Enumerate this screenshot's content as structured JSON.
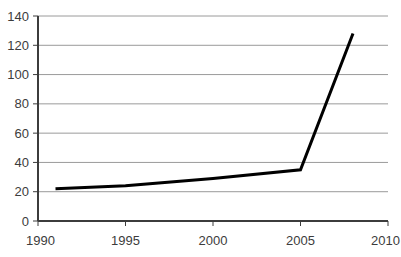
{
  "chart_data": {
    "type": "line",
    "title": "",
    "subtitle": "",
    "xlabel": "",
    "ylabel": "",
    "xlim": [
      1990,
      2010
    ],
    "ylim": [
      0,
      140
    ],
    "grid": true,
    "legend": false,
    "legend_position": "none",
    "x_ticks": [
      1990,
      1995,
      2000,
      2005,
      2010
    ],
    "y_ticks": [
      0,
      20,
      40,
      60,
      80,
      100,
      120,
      140
    ],
    "x_tick_labels": [
      "1990",
      "1995",
      "2000",
      "2005",
      "2010"
    ],
    "y_tick_labels": [
      "0",
      "20",
      "40",
      "60",
      "80",
      "100",
      "120",
      "140"
    ],
    "series": [
      {
        "name": "series-1",
        "color": "#000000",
        "line_width": 3,
        "x": [
          1991,
          1993,
          1995,
          2000,
          2005,
          2008
        ],
        "values": [
          22,
          23,
          24,
          29,
          35,
          128
        ]
      }
    ],
    "annotations": []
  },
  "style": {
    "background": "#ffffff",
    "axis_color": "#3c3c3c",
    "grid_color": "#9a9a9a",
    "tick_label_color": "#3c3c3c",
    "line_color": "#000000"
  }
}
